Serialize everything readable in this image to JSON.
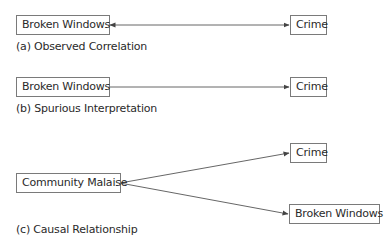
{
  "panels": [
    {
      "id": "a",
      "caption": "(a) Observed Correlation",
      "nodes": [
        {
          "id": "a-broken-windows",
          "label": "Broken Windows"
        },
        {
          "id": "a-crime",
          "label": "Crime"
        }
      ],
      "edges": [
        {
          "from": "Broken Windows",
          "to": "Crime",
          "type": "bidirectional"
        }
      ]
    },
    {
      "id": "b",
      "caption": "(b) Spurious Interpretation",
      "nodes": [
        {
          "id": "b-broken-windows",
          "label": "Broken Windows"
        },
        {
          "id": "b-crime",
          "label": "Crime"
        }
      ],
      "edges": [
        {
          "from": "Broken Windows",
          "to": "Crime",
          "type": "directed"
        }
      ]
    },
    {
      "id": "c",
      "caption": "(c) Causal Relationship",
      "nodes": [
        {
          "id": "c-community-malaise",
          "label": "Community Malaise"
        },
        {
          "id": "c-crime",
          "label": "Crime"
        },
        {
          "id": "c-broken-windows",
          "label": "Broken Windows"
        }
      ],
      "edges": [
        {
          "from": "Community Malaise",
          "to": "Crime",
          "type": "directed"
        },
        {
          "from": "Community Malaise",
          "to": "Broken Windows",
          "type": "directed"
        }
      ]
    }
  ],
  "colors": {
    "line": "#555555",
    "border": "#7a7a7a",
    "text": "#2a2a2a"
  }
}
